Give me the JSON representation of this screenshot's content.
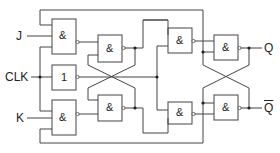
{
  "diagram": {
    "inputs": {
      "j": "J",
      "clk": "CLK",
      "k": "K"
    },
    "outputs": {
      "q": "Q",
      "q_bar": "Q"
    },
    "gates": [
      {
        "id": "g1",
        "type": "NAND",
        "symbol": "&",
        "role": "master-input-j"
      },
      {
        "id": "g2",
        "type": "NOT",
        "symbol": "1",
        "role": "clock-inverter"
      },
      {
        "id": "g3",
        "type": "NAND",
        "symbol": "&",
        "role": "master-input-k"
      },
      {
        "id": "g4",
        "type": "NAND",
        "symbol": "&",
        "role": "master-latch-upper"
      },
      {
        "id": "g5",
        "type": "NAND",
        "symbol": "&",
        "role": "master-latch-lower"
      },
      {
        "id": "g6",
        "type": "NAND",
        "symbol": "&",
        "role": "slave-input-upper"
      },
      {
        "id": "g7",
        "type": "NAND",
        "symbol": "&",
        "role": "slave-input-lower"
      },
      {
        "id": "g8",
        "type": "NAND",
        "symbol": "&",
        "role": "slave-latch-q"
      },
      {
        "id": "g9",
        "type": "NAND",
        "symbol": "&",
        "role": "slave-latch-qbar"
      }
    ],
    "colors": {
      "line": "#444444",
      "background": "#ffffff"
    }
  }
}
